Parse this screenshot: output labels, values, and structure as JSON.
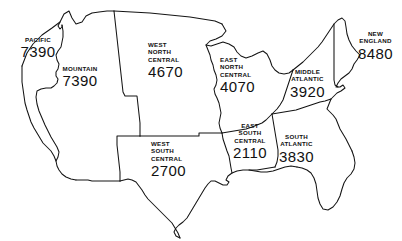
{
  "map": {
    "title": "United States Census Divisions Map",
    "background_color": "#ffffff",
    "line_color": "#141414",
    "text_color": "#111111",
    "regions": [
      {
        "id": "pacific",
        "name": "PACIFIC",
        "name_lines": [
          "PACIFIC"
        ],
        "value": "7390"
      },
      {
        "id": "mountain",
        "name": "MOUNTAIN",
        "name_lines": [
          "MOUNTAIN"
        ],
        "value": "7390"
      },
      {
        "id": "west-north-central",
        "name": "WEST NORTH CENTRAL",
        "name_lines": [
          "WEST",
          "NORTH",
          "CENTRAL"
        ],
        "value": "4670"
      },
      {
        "id": "east-north-central",
        "name": "EAST NORTH CENTRAL",
        "name_lines": [
          "EAST",
          "NORTH",
          "CENTRAL"
        ],
        "value": "4070"
      },
      {
        "id": "middle-atlantic",
        "name": "MIDDLE ATLANTIC",
        "name_lines": [
          "MIDDLE",
          "ATLANTIC"
        ],
        "value": "3920"
      },
      {
        "id": "new-england",
        "name": "NEW ENGLAND",
        "name_lines": [
          "NEW",
          "ENGLAND"
        ],
        "value": "8480"
      },
      {
        "id": "west-south-central",
        "name": "WEST SOUTH CENTRAL",
        "name_lines": [
          "WEST",
          "SOUTH",
          "CENTRAL"
        ],
        "value": "2700"
      },
      {
        "id": "east-south-central",
        "name": "EAST SOUTH CENTRAL",
        "name_lines": [
          "EAST",
          "SOUTH",
          "CENTRAL"
        ],
        "value": "2110"
      },
      {
        "id": "south-atlantic",
        "name": "SOUTH ATLANTIC",
        "name_lines": [
          "SOUTH",
          "ATLANTIC"
        ],
        "value": "3830"
      }
    ]
  }
}
